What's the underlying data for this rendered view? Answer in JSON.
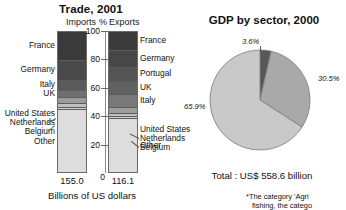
{
  "trade": {
    "title": "Trade, 2001",
    "header_imports": "Imports",
    "header_percent": "%",
    "header_exports": "Exports",
    "axis_caption": "Billions of US dollars",
    "imports_total": "155.0",
    "exports_total": "116.1",
    "axis_ticks": [
      "100",
      "80",
      "60",
      "40",
      "20",
      "0"
    ]
  },
  "gdp": {
    "title": "GDP by sector, 2000",
    "total": "Total : US$ 558.6 billion",
    "footnote_line1": "*The category 'Agri",
    "footnote_line2": "fishing, the catego"
  },
  "chart_data": [
    {
      "type": "bar",
      "subtype": "stacked-100",
      "title": "Trade, 2001",
      "xlabel": "Billions of US dollars",
      "ylabel": "%",
      "ylim": [
        0,
        100
      ],
      "grid": false,
      "categories": [
        "Imports",
        "Exports"
      ],
      "category_totals": [
        "155.0",
        "116.1"
      ],
      "series": [
        {
          "name": "France",
          "values": [
            19.5,
            13.0
          ],
          "color": "#3a3a3a"
        },
        {
          "name": "Germany",
          "values": [
            14.5,
            11.5
          ],
          "color": "#4a4a4a"
        },
        {
          "name": "Italy",
          "values": [
            7.0,
            8.5
          ],
          "color": "#5c5c5c"
        },
        {
          "name": "Portugal",
          "values": [
            0.0,
            10.0
          ],
          "color": "#545454"
        },
        {
          "name": "UK",
          "values": [
            5.0,
            9.5
          ],
          "color": "#6e6e6e"
        },
        {
          "name": "United States",
          "values": [
            4.0,
            4.5
          ],
          "color": "#9a9a9a"
        },
        {
          "name": "Netherlands",
          "values": [
            2.5,
            2.0
          ],
          "color": "#bdbdbd"
        },
        {
          "name": "Belgium",
          "values": [
            2.0,
            1.5
          ],
          "color": "#cfcfcf"
        },
        {
          "name": "Other",
          "values": [
            45.5,
            39.5
          ],
          "color": "#dcdcdc"
        }
      ],
      "imports_labels": [
        "France",
        "Germany",
        "Italy",
        "UK",
        "United States",
        "Netherlands",
        "Belgium",
        "Other"
      ],
      "exports_labels": [
        "France",
        "Germany",
        "Portugal",
        "UK",
        "Italy",
        "United States",
        "Netherlands",
        "Belgium",
        "Other"
      ]
    },
    {
      "type": "pie",
      "title": "GDP by sector, 2000",
      "total_label": "Total : US$ 558.6 billion",
      "labels": [
        "3.6%",
        "30.5%",
        "65.9%"
      ],
      "values": [
        3.6,
        30.5,
        65.9
      ],
      "colors": [
        "#585858",
        "#a9a9a9",
        "#c9c9c9"
      ],
      "legend": "none"
    }
  ],
  "bars": {
    "imports": [
      {
        "label": "France",
        "pct": 19.5,
        "color": "#3a3a3a"
      },
      {
        "label": "Germany",
        "pct": 14.5,
        "color": "#4a4a4a"
      },
      {
        "label": "Italy",
        "pct": 7.0,
        "color": "#5a5a5a"
      },
      {
        "label": "UK",
        "pct": 5.0,
        "color": "#707070"
      },
      {
        "label": "United States",
        "pct": 4.0,
        "color": "#9c9c9c"
      },
      {
        "label": "Netherlands",
        "pct": 2.5,
        "color": "#bebebe"
      },
      {
        "label": "Belgium",
        "pct": 2.0,
        "color": "#d0d0d0"
      },
      {
        "label": "Other",
        "pct": 45.5,
        "color": "#dddddd"
      }
    ],
    "exports": [
      {
        "label": "France",
        "pct": 13.0,
        "color": "#3a3a3a"
      },
      {
        "label": "Germany",
        "pct": 11.5,
        "color": "#474747"
      },
      {
        "label": "Portugal",
        "pct": 10.0,
        "color": "#545454"
      },
      {
        "label": "UK",
        "pct": 9.5,
        "color": "#616161"
      },
      {
        "label": "Italy",
        "pct": 8.5,
        "color": "#787878"
      },
      {
        "label": "United States",
        "pct": 4.5,
        "color": "#9c9c9c"
      },
      {
        "label": "Netherlands",
        "pct": 2.0,
        "color": "#c2c2c2"
      },
      {
        "label": "Belgium",
        "pct": 1.5,
        "color": "#d2d2d2"
      },
      {
        "label": "Other",
        "pct": 39.5,
        "color": "#dddddd"
      }
    ]
  },
  "pie": {
    "slices": [
      {
        "label": "3.6%",
        "value": 3.6,
        "color": "#585858"
      },
      {
        "label": "30.5%",
        "value": 30.5,
        "color": "#a9a9a9"
      },
      {
        "label": "65.9%",
        "value": 65.9,
        "color": "#c9c9c9"
      }
    ]
  }
}
